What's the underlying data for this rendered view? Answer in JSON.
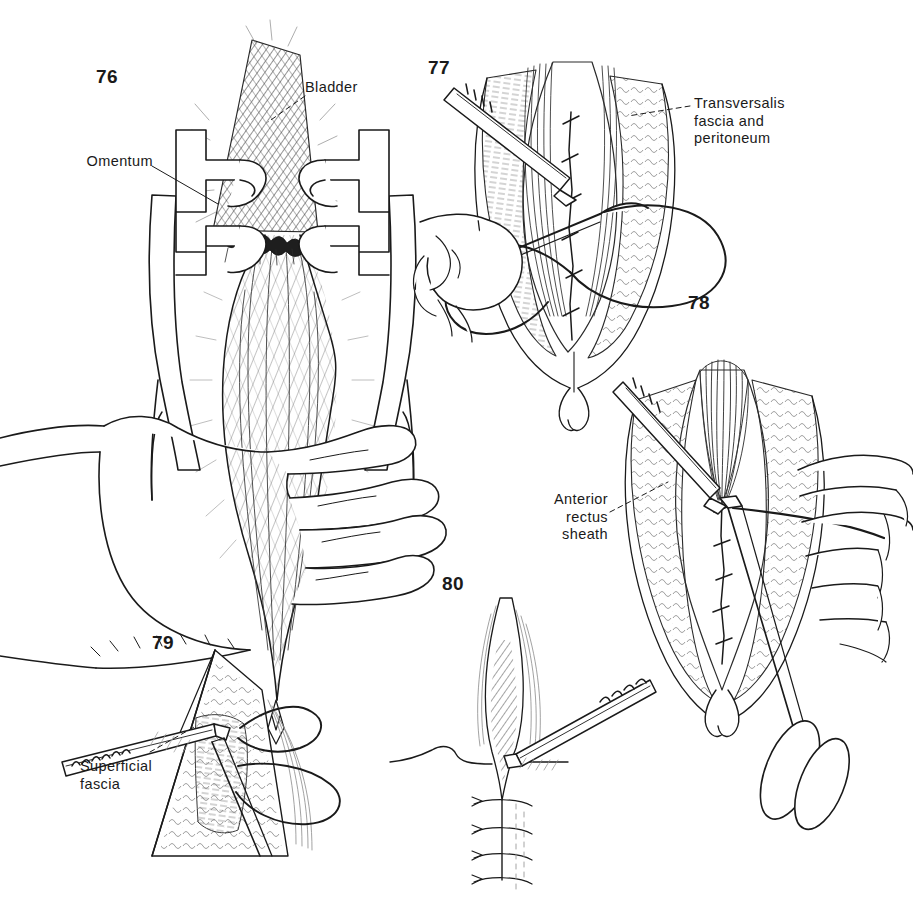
{
  "plate": {
    "background_color": "#ffffff",
    "ink_color": "#1a1a1a",
    "width": 913,
    "height": 902
  },
  "figures": [
    {
      "number": "76",
      "caption_labels": [
        "Bladder",
        "Omentum"
      ],
      "description": "Retractor-held abdominal wound with bladder and omentum exposed, surgeon's hand gripping retractor"
    },
    {
      "number": "77",
      "caption_labels": [
        "Transversalis\nfascia and\nperitoneum"
      ],
      "description": "Closure of transversalis fascia and peritoneum with running suture, forceps and needle holder"
    },
    {
      "number": "78",
      "caption_labels": [
        "Anterior\nrectus\nsheath"
      ],
      "description": "Closure of anterior rectus sheath, scissors cutting suture"
    },
    {
      "number": "79",
      "caption_labels": [
        "Superficial\nfascia"
      ],
      "description": "Closure of superficial fascia with forceps and suture"
    },
    {
      "number": "80",
      "caption_labels": [],
      "description": "Skin closure with interrupted sutures and forceps"
    }
  ],
  "labels": {
    "bladder": "Bladder",
    "omentum": "Omentum",
    "transversalis": "Transversalis\nfascia and\nperitoneum",
    "anterior_rectus_sheath": "Anterior\nrectus\nsheath",
    "superficial_fascia": "Superficial\nfascia"
  },
  "numbers": {
    "n76": "76",
    "n77": "77",
    "n78": "78",
    "n79": "79",
    "n80": "80"
  }
}
